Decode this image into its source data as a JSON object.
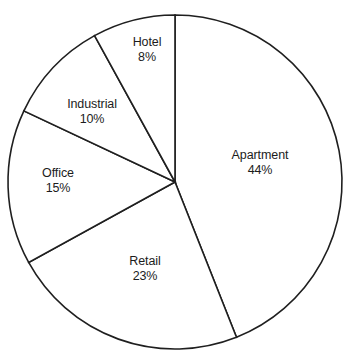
{
  "chart_data": {
    "type": "pie",
    "title": "",
    "subtitle": "",
    "xlabel": "",
    "ylabel": "",
    "legend": "none",
    "grid": false,
    "start_angle_deg": 0,
    "direction": "clockwise",
    "units": "percent",
    "total": 100,
    "categories": [
      "Apartment",
      "Retail",
      "Office",
      "Industrial",
      "Hotel"
    ],
    "values": [
      44,
      23,
      15,
      10,
      8
    ],
    "slices": [
      {
        "label": "Apartment",
        "value": 44,
        "value_text": "44%",
        "start_deg": 0,
        "end_deg": 158.4,
        "label_x": 260,
        "label_y": 163
      },
      {
        "label": "Retail",
        "value": 23,
        "value_text": "23%",
        "start_deg": 158.4,
        "end_deg": 241.2,
        "label_x": 145,
        "label_y": 269
      },
      {
        "label": "Office",
        "value": 15,
        "value_text": "15%",
        "start_deg": 241.2,
        "end_deg": 295.2,
        "label_x": 58,
        "label_y": 181
      },
      {
        "label": "Industrial",
        "value": 10,
        "value_text": "10%",
        "start_deg": 295.2,
        "end_deg": 331.2,
        "label_x": 92,
        "label_y": 112
      },
      {
        "label": "Hotel",
        "value": 8,
        "value_text": "8%",
        "start_deg": 331.2,
        "end_deg": 360,
        "label_x": 147,
        "label_y": 50
      }
    ],
    "geometry": {
      "center_x": 175,
      "center_y": 182,
      "radius": 167
    },
    "colors": {
      "slice_fill": "#ffffff",
      "stroke": "#1f1f1f",
      "background": "#ffffff",
      "text": "#1c1c1c"
    }
  }
}
